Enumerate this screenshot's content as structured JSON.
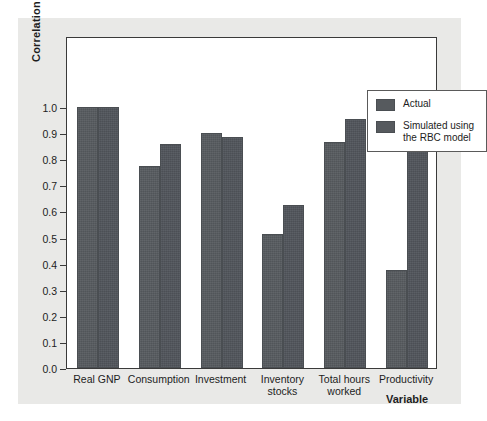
{
  "chart_data": {
    "type": "bar",
    "title": "",
    "xlabel": "Variable",
    "ylabel": "Correlation",
    "categories": [
      "Real GNP",
      "Consumption",
      "Investment",
      "Inventory\nstocks",
      "Total hours\nworked",
      "Productivity"
    ],
    "series": [
      {
        "name": "Actual",
        "values": [
          1.0,
          0.775,
          0.9,
          0.515,
          0.865,
          0.375
        ],
        "color": "#565a5e"
      },
      {
        "name": "Simulated using\nthe RBC model",
        "values": [
          1.0,
          0.86,
          0.885,
          0.625,
          0.955,
          0.875
        ],
        "color": "#50545a"
      }
    ],
    "ylim": [
      0.0,
      1.0
    ],
    "ytick_labels": [
      "1.0",
      "0.9",
      "0.8",
      "0.7",
      "0.6",
      "0.5",
      "0.4",
      "0.3",
      "0.2",
      "0.1",
      "0.0"
    ],
    "ytick_values": [
      1.0,
      0.9,
      0.8,
      0.7,
      0.6,
      0.5,
      0.4,
      0.3,
      0.2,
      0.1,
      0.0
    ],
    "grid": false,
    "legend_position": "top-right"
  },
  "legend": {
    "entries": [
      {
        "label": "Actual"
      },
      {
        "label": "Simulated using\nthe RBC model"
      }
    ]
  },
  "axis": {
    "y_title": "Correlation",
    "x_title": "Variable"
  }
}
